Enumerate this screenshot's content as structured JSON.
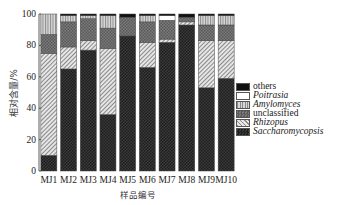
{
  "chart_data": {
    "type": "bar",
    "stacked": true,
    "title": "",
    "xlabel": "样品编号",
    "ylabel": "相对含量/%",
    "ylim": [
      0,
      100
    ],
    "yticks": [
      0,
      20,
      40,
      60,
      80,
      100
    ],
    "categories": [
      "MJ1",
      "MJ2",
      "MJ3",
      "MJ4",
      "MJ5",
      "MJ6",
      "MJ7",
      "MJ8",
      "MJ9",
      "MJ10"
    ],
    "series": [
      {
        "name": "Saccharomycopsis",
        "italic": true,
        "pattern": "dark-checker",
        "values": [
          10,
          65,
          77,
          36,
          86,
          66,
          82,
          93,
          53,
          59
        ]
      },
      {
        "name": "Rhizopus",
        "italic": true,
        "pattern": "light-diagonal",
        "values": [
          65,
          14,
          6,
          42,
          0,
          16,
          2,
          2,
          30,
          24
        ]
      },
      {
        "name": "unclassified",
        "italic": false,
        "pattern": "mid-checker",
        "values": [
          12,
          16,
          14,
          13,
          12,
          13,
          12,
          3,
          10,
          10
        ]
      },
      {
        "name": "Amylomyces",
        "italic": true,
        "pattern": "vertical-lines",
        "values": [
          13,
          4,
          2,
          8,
          0,
          4,
          0,
          0,
          6,
          6
        ]
      },
      {
        "name": "Poitrasia",
        "italic": true,
        "pattern": "white",
        "values": [
          0,
          0,
          0,
          0,
          0,
          0,
          3,
          0,
          0,
          0
        ]
      },
      {
        "name": "others",
        "italic": false,
        "pattern": "black",
        "values": [
          0,
          1,
          1,
          1,
          2,
          1,
          1,
          2,
          1,
          1
        ]
      }
    ],
    "grid": false,
    "legend_position": "right"
  },
  "legend": {
    "items": [
      {
        "label": "others",
        "italic": false
      },
      {
        "label": "Poitrasia",
        "italic": true
      },
      {
        "label": "Amylomyces",
        "italic": true
      },
      {
        "label": "unclassified",
        "italic": false
      },
      {
        "label": "Rhizopus",
        "italic": true
      },
      {
        "label": "Saccharomycopsis",
        "italic": true
      }
    ]
  }
}
